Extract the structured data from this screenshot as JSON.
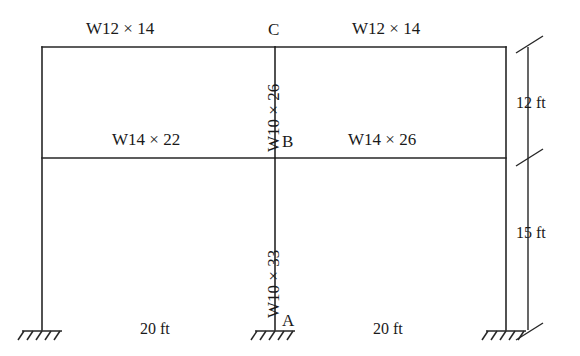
{
  "diagram": {
    "stroke_color": "#262626",
    "background_color": "#ffffff"
  },
  "beams": {
    "top_left": {
      "label": "W12 × 14"
    },
    "top_right": {
      "label": "W12 × 14"
    },
    "mid_left": {
      "label": "W14 × 22"
    },
    "mid_right": {
      "label": "W14 × 26"
    }
  },
  "columns": {
    "center_upper": {
      "label": "W10 × 26"
    },
    "center_lower": {
      "label": "W10 × 33"
    }
  },
  "joints": {
    "a": {
      "label": "A"
    },
    "b": {
      "label": "B"
    },
    "c": {
      "label": "C"
    }
  },
  "dimensions": {
    "story_upper": {
      "label": "12 ft"
    },
    "story_lower": {
      "label": "15 ft"
    },
    "bay_left": {
      "label": "20 ft"
    },
    "bay_right": {
      "label": "20 ft"
    }
  },
  "supports": {
    "left": {
      "type": "fixed-support"
    },
    "center": {
      "type": "fixed-support"
    },
    "right": {
      "type": "fixed-support"
    }
  }
}
